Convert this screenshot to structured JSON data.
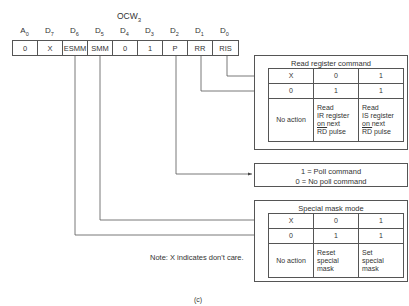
{
  "register": {
    "title": "OCW",
    "title_sub": "3",
    "headers": [
      {
        "main": "A",
        "sub": "0"
      },
      {
        "main": "D",
        "sub": "7"
      },
      {
        "main": "D",
        "sub": "6"
      },
      {
        "main": "D",
        "sub": "5"
      },
      {
        "main": "D",
        "sub": "4"
      },
      {
        "main": "D",
        "sub": "3"
      },
      {
        "main": "D",
        "sub": "2"
      },
      {
        "main": "D",
        "sub": "1"
      },
      {
        "main": "D",
        "sub": "0"
      }
    ],
    "bits": [
      "0",
      "X",
      "ESMM",
      "SMM",
      "0",
      "1",
      "P",
      "RR",
      "RIS"
    ]
  },
  "read_register": {
    "title": "Read register command",
    "rows": [
      [
        "X",
        "0",
        "1"
      ],
      [
        "0",
        "1",
        "1"
      ]
    ],
    "actions": [
      "No action",
      "Read\nIR register\non next\nRD pulse",
      "Read\nIS register\non next\nRD pulse"
    ],
    "overline": "RD",
    "action_lines": [
      [
        "No action"
      ],
      [
        "Read",
        "IR register",
        "on next",
        "RD pulse"
      ],
      [
        "Read",
        "IS register",
        "on next",
        "RD pulse"
      ]
    ]
  },
  "poll": {
    "line1": "1 = Poll command",
    "line2": "0 = No poll command"
  },
  "special_mask": {
    "title": "Special mask mode",
    "rows": [
      [
        "X",
        "0",
        "1"
      ],
      [
        "0",
        "1",
        "1"
      ]
    ],
    "action_lines": [
      [
        "No action"
      ],
      [
        "Reset",
        "special",
        "mask"
      ],
      [
        "Set",
        "special",
        "mask"
      ]
    ]
  },
  "note": "Note:  X indicates don't care.",
  "caption": "(c)",
  "colors": {
    "line": "#555555",
    "text": "#333333",
    "background": "#ffffff"
  }
}
